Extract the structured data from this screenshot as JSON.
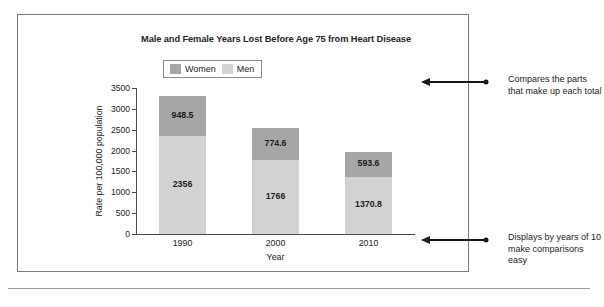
{
  "chart_data": {
    "type": "bar",
    "subtype": "stacked-bar",
    "title": "Male and Female Years Lost Before Age 75 from Heart Disease",
    "xlabel": "Year",
    "ylabel": "Rate per 100,000 population",
    "categories": [
      "1990",
      "2000",
      "2010"
    ],
    "ylim": [
      0,
      3500
    ],
    "yticks": [
      0,
      500,
      1000,
      1500,
      2000,
      2500,
      3000,
      3500
    ],
    "ytick_labels": [
      "0",
      "500",
      "1000",
      "1500",
      "2000",
      "2500",
      "3000",
      "3500"
    ],
    "grid": false,
    "legend_position": "top-left-inside",
    "series": [
      {
        "name": "Women",
        "color": "#a6a6a6",
        "values": [
          948.5,
          774.6,
          593.6
        ],
        "labels": [
          "948.5",
          "774.6",
          "593.6"
        ]
      },
      {
        "name": "Men",
        "color": "#d2d2d2",
        "values": [
          2356,
          1766,
          1370.8
        ],
        "labels": [
          "2356",
          "1766",
          "1370.8"
        ]
      }
    ],
    "stack_order_bottom_to_top": [
      "Men",
      "Women"
    ],
    "totals": [
      3304.5,
      2540.6,
      1964.4
    ]
  },
  "annotations": [
    {
      "id": "top",
      "text": "Compares the parts that make up each total"
    },
    {
      "id": "bottom",
      "text": "Displays by years of 10 make comparisons easy"
    }
  ],
  "colors": {
    "women": "#a6a6a6",
    "men": "#d2d2d2",
    "axis": "#4a4a4a",
    "frame": "#7a7a7a",
    "text": "#1d1d1d"
  }
}
